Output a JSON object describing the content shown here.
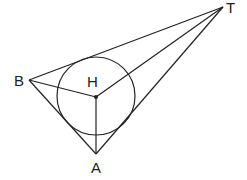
{
  "diagram": {
    "type": "geometry",
    "points": {
      "T": {
        "label": "T",
        "x": 223,
        "y": 7
      },
      "B": {
        "label": "B",
        "x": 29,
        "y": 80
      },
      "H": {
        "label": "H",
        "x": 96,
        "y": 97
      },
      "A": {
        "label": "A",
        "x": 96,
        "y": 154
      }
    },
    "circle": {
      "center": "H",
      "cx": 96,
      "cy": 96,
      "r": 39
    },
    "segments": [
      [
        "T",
        "B"
      ],
      [
        "T",
        "A"
      ],
      [
        "B",
        "A"
      ],
      [
        "T",
        "H"
      ],
      [
        "B",
        "H"
      ],
      [
        "H",
        "A"
      ]
    ],
    "colors": {
      "stroke": "#222222",
      "background": "#ffffff"
    }
  }
}
